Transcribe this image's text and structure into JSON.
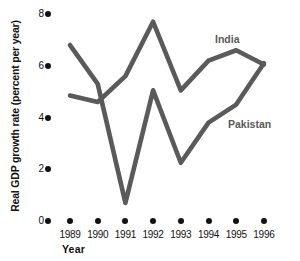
{
  "chart_data": {
    "type": "line",
    "title": "",
    "xlabel": "Year",
    "ylabel": "Real GDP growth rate (percent per year)",
    "x": [
      1989,
      1990,
      1991,
      1992,
      1993,
      1994,
      1995,
      1996
    ],
    "xtick_labels": [
      "1989",
      "1990",
      "1991",
      "1992",
      "1993",
      "1994",
      "1995",
      "1996"
    ],
    "ytick_labels": [
      "0",
      "2",
      "4",
      "6",
      "8"
    ],
    "yticks": [
      0,
      2,
      4,
      6,
      8
    ],
    "ylim": [
      0,
      8
    ],
    "xlim": [
      1989,
      1996
    ],
    "grid": false,
    "legend": "inline-annotations",
    "line_color": "#5a5a5a",
    "axis_color": "#111111",
    "series": [
      {
        "name": "India",
        "label": "India",
        "values": [
          4.85,
          4.6,
          5.6,
          7.7,
          5.05,
          6.2,
          6.6,
          6.05
        ]
      },
      {
        "name": "Pakistan",
        "label": "Pakistan",
        "values": [
          6.8,
          5.3,
          0.7,
          5.05,
          2.25,
          3.8,
          4.5,
          6.1
        ]
      }
    ]
  },
  "annotations": {
    "india": "India",
    "pakistan": "Pakistan"
  }
}
